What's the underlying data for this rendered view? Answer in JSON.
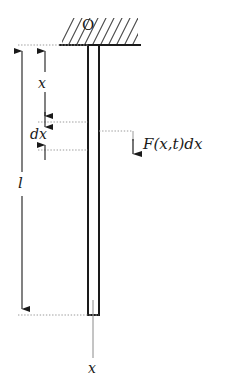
{
  "figure": {
    "width": 230,
    "height": 390,
    "background_color": "#ffffff",
    "line_color": "#1a1a1a",
    "dotted_color": "#8a8a8a",
    "rod_fill_color": "#ffffff"
  },
  "labels": {
    "support_point": "O",
    "x_dimension": "x",
    "dx_dimension": "dx",
    "length_dimension": "l",
    "force": "F(x,t)dx",
    "x_axis": "x"
  },
  "geometry": {
    "support_line": {
      "x1": 59,
      "y1": 45,
      "x2": 141,
      "y2": 45
    },
    "hatch_region": {
      "x": 62,
      "y": 18,
      "width": 76,
      "height": 27
    },
    "rod": {
      "x": 88,
      "y": 45,
      "width": 11,
      "height": 270
    },
    "length_dim_line": {
      "x": 22,
      "y_top": 45,
      "y_bottom": 315
    },
    "x_dim_line": {
      "x": 45,
      "y_top": 45,
      "y_bottom": 122
    },
    "dx_dim_line": {
      "x": 45,
      "y_top": 122,
      "y_bottom": 150
    },
    "extension_lines_y": [
      45,
      122,
      150,
      315
    ],
    "force_leader": {
      "x_start": 99,
      "y": 131,
      "x_corner": 133,
      "y_arrow_end": 159
    },
    "x_axis_line": {
      "x": 93,
      "y_top": 315,
      "y_bottom": 358
    }
  }
}
